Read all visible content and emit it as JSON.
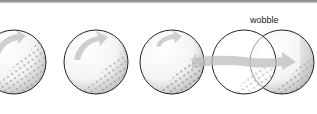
{
  "diagram": {
    "labels": {
      "wobble": "wobble"
    },
    "balls": [
      {
        "id": "ball-1",
        "cx": 14,
        "cy": 62,
        "r": 32,
        "arrow": "curved-up"
      },
      {
        "id": "ball-2",
        "cx": 96,
        "cy": 62,
        "r": 32,
        "arrow": "curved-up"
      },
      {
        "id": "ball-3",
        "cx": 172,
        "cy": 62,
        "r": 32,
        "arrow": "curved-up"
      },
      {
        "id": "ball-4",
        "cx": 244,
        "cy": 62,
        "r": 32,
        "arrow": "none"
      },
      {
        "id": "ball-5",
        "cx": 282,
        "cy": 62,
        "r": 32,
        "arrow": "none"
      }
    ],
    "wobble_arrow": {
      "from_x": 190,
      "to_x": 300,
      "y": 62
    },
    "colors": {
      "outline": "#222222",
      "arrow": "#cfcfcf",
      "dimple_shade": "#9a9a9a",
      "background": "#ffffff"
    }
  }
}
